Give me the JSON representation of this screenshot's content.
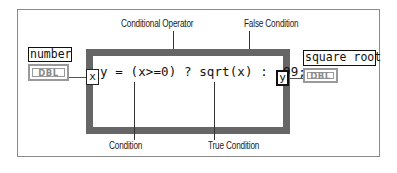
{
  "diagram": {
    "type": "LabVIEW Formula Node block diagram",
    "formula": "y = (x>=0) ? sqrt(x) : -99;",
    "input": {
      "label": "number",
      "type": "DBL",
      "terminal": "x"
    },
    "output": {
      "label": "square root",
      "type": "DBL",
      "terminal": "y"
    },
    "annotations": {
      "top": [
        "Conditional Operator",
        "False Condition"
      ],
      "bottom": [
        "Condition",
        "True Condition"
      ]
    },
    "colors": {
      "node_border": "#666666",
      "frame": "#8a8a8a",
      "dbl_terminal": "#9a9a9a"
    }
  }
}
